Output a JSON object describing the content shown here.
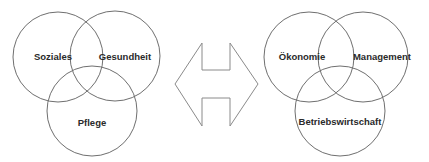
{
  "diagram": {
    "left_venn": {
      "circles": [
        {
          "label": "Soziales",
          "cx": 58,
          "cy": 57,
          "r": 45,
          "lx": 53,
          "ly": 57
        },
        {
          "label": "Gesundheit",
          "cx": 115,
          "cy": 56,
          "r": 45,
          "lx": 125,
          "ly": 57
        },
        {
          "label": "Pflege",
          "cx": 92,
          "cy": 111,
          "r": 45,
          "lx": 92,
          "ly": 123
        }
      ]
    },
    "connector": {
      "type": "double-headed-arrow",
      "points": "175,84 202,43 202,70 230,70 230,43 258,84 230,126 230,98 202,98 202,126"
    },
    "right_venn": {
      "circles": [
        {
          "label": "Ökonomie",
          "cx": 309,
          "cy": 57,
          "r": 45,
          "lx": 302,
          "ly": 57
        },
        {
          "label": "Management",
          "cx": 363,
          "cy": 57,
          "r": 45,
          "lx": 382,
          "ly": 57
        },
        {
          "label": "Betriebswirtschaft",
          "cx": 340,
          "cy": 111,
          "r": 45,
          "lx": 340,
          "ly": 122
        }
      ]
    },
    "colors": {
      "stroke": "#6f6f6f",
      "text": "#2a2a2a",
      "background": "#ffffff"
    }
  }
}
